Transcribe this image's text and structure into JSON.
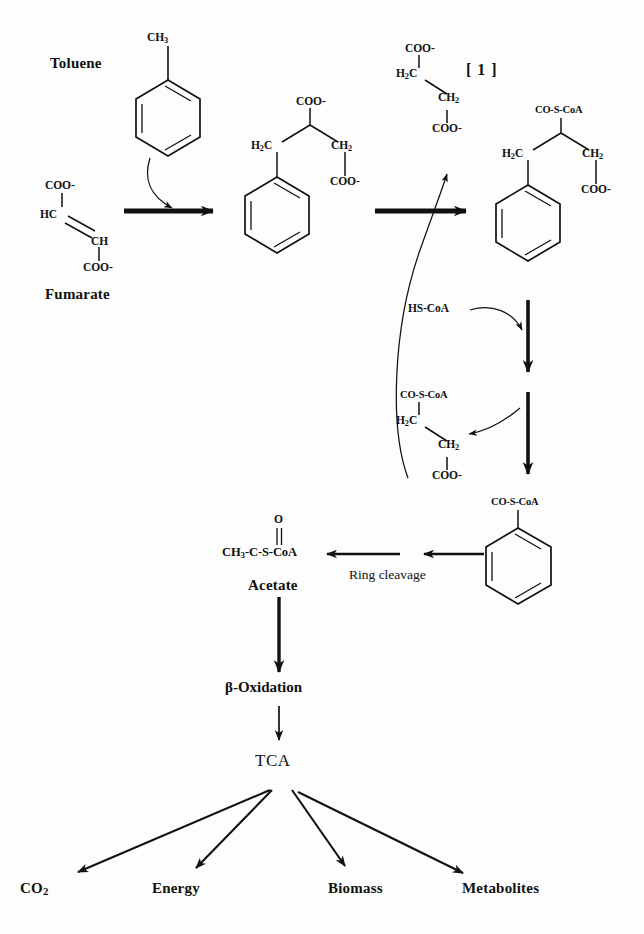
{
  "figure": {
    "domain_type": "biochemical-pathway-diagram",
    "title_text": "",
    "background_color": "#fdfdfd",
    "stroke_color": "#111111"
  },
  "labels": {
    "toluene": "Toluene",
    "fumarate": "Fumarate",
    "step_one_bracket": "[ 1 ]",
    "hs_coa": "HS-CoA",
    "ring_cleavage": "Ring cleavage",
    "acetate": "Acetate",
    "beta_oxidation": "β-Oxidation",
    "tca": "TCA"
  },
  "products": [
    {
      "id": "co2",
      "label": "CO",
      "sub": "2"
    },
    {
      "id": "energy",
      "label": "Energy",
      "sub": ""
    },
    {
      "id": "biomass",
      "label": "Biomass",
      "sub": ""
    },
    {
      "id": "metabolites",
      "label": "Metabolites",
      "sub": ""
    }
  ],
  "structures": {
    "toluene": {
      "name": "Toluene",
      "substituent": "CH",
      "substituent_sub": "3",
      "ring": "benzene"
    },
    "fumarate": {
      "name": "Fumarate",
      "atoms": [
        "COO-",
        "HC",
        "CH",
        "COO-"
      ],
      "top_carboxyl": "COO-",
      "left_carbon": "HC",
      "right_carbon": "CH",
      "bottom_carboxyl": "COO-"
    },
    "benzylsuccinate": {
      "name": "Benzylsuccinate",
      "top_group": "COO-",
      "left_group": "H",
      "left_group_sub": "2",
      "left_group_tail": "C",
      "right_group": "CH",
      "right_group_sub": "2",
      "bottom_group": "COO-",
      "ring": "benzene"
    },
    "benzylsuccinyl_coa": {
      "name": "Benzylsuccinyl-CoA",
      "top_group": "CO-S-CoA",
      "left_group": "H",
      "left_group_sub": "2",
      "left_group_tail": "C",
      "right_group": "CH",
      "right_group_sub": "2",
      "bottom_group": "COO-",
      "ring": "benzene"
    },
    "succinate": {
      "name": "Succinate",
      "top_group": "COO-",
      "left_group": "H",
      "left_group_sub": "2",
      "left_group_tail": "C",
      "right_group": "CH",
      "right_group_sub": "2",
      "bottom_group": "COO-"
    },
    "succinyl_coa": {
      "name": "Succinyl-CoA",
      "top_group": "CO-S-CoA",
      "left_group": "H",
      "left_group_sub": "2",
      "left_group_tail": "C",
      "right_group": "CH",
      "right_group_sub": "2",
      "bottom_group": "COO-"
    },
    "benzoyl_coa": {
      "name": "Benzoyl-CoA",
      "top_group": "CO-S-CoA",
      "ring": "benzene"
    },
    "acetyl_coa": {
      "name": "Acetyl-CoA",
      "carbonyl_oxygen": "O",
      "chain": "CH",
      "chain_sub": "3",
      "chain_tail": "-C-S-CoA"
    }
  },
  "arrows": [
    {
      "id": "fumarate-to-benzylsuccinate",
      "kind": "thick-straight",
      "direction": "right"
    },
    {
      "id": "toluene-into-reaction",
      "kind": "curved-thin",
      "direction": "down-right"
    },
    {
      "id": "benzylsuccinate-to-benzylsuccinyl-coa",
      "kind": "thick-straight",
      "direction": "right"
    },
    {
      "id": "succinyl-coa-to-succinate",
      "kind": "curved-thin",
      "direction": "up"
    },
    {
      "id": "hs-coa-entry",
      "kind": "curved-thin",
      "direction": "down-right"
    },
    {
      "id": "benzylsuccinyl-coa-down",
      "kind": "thick-straight",
      "direction": "down"
    },
    {
      "id": "to-succinyl-coa",
      "kind": "curved-thin",
      "direction": "left"
    },
    {
      "id": "down-to-benzoyl-coa",
      "kind": "thick-straight",
      "direction": "down"
    },
    {
      "id": "benzoyl-coa-to-acetate-outer",
      "kind": "thin-straight",
      "direction": "left"
    },
    {
      "id": "benzoyl-coa-to-acetate-inner",
      "kind": "thin-straight",
      "direction": "left"
    },
    {
      "id": "acetate-to-beta-oxidation",
      "kind": "thick-straight",
      "direction": "down"
    },
    {
      "id": "beta-oxidation-to-tca",
      "kind": "thin-straight",
      "direction": "down"
    },
    {
      "id": "tca-to-co2",
      "kind": "thin-straight",
      "direction": "down-left"
    },
    {
      "id": "tca-to-energy",
      "kind": "thin-straight",
      "direction": "down-left"
    },
    {
      "id": "tca-to-biomass",
      "kind": "thin-straight",
      "direction": "down-right"
    },
    {
      "id": "tca-to-metabolites",
      "kind": "thin-straight",
      "direction": "down-right"
    }
  ]
}
